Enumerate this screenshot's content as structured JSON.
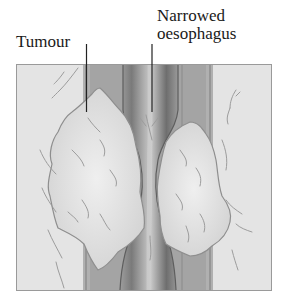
{
  "diagram": {
    "labels": {
      "tumour": "Tumour",
      "narrowed_line1": "Narrowed",
      "narrowed_line2": "oesophagus"
    },
    "colors": {
      "background": "#e4e4e4",
      "frame": "#9a9a9a",
      "tumour_fill": "#d9d9d9",
      "tumour_highlight": "#ececec",
      "wall_outer": "#a8a8a8",
      "wall_mid": "#8c8c8c",
      "lumen_dark": "#6e6e6e",
      "vein": "#9c9c9c",
      "leader_line": "#222222",
      "text": "#1a1a1a"
    }
  }
}
